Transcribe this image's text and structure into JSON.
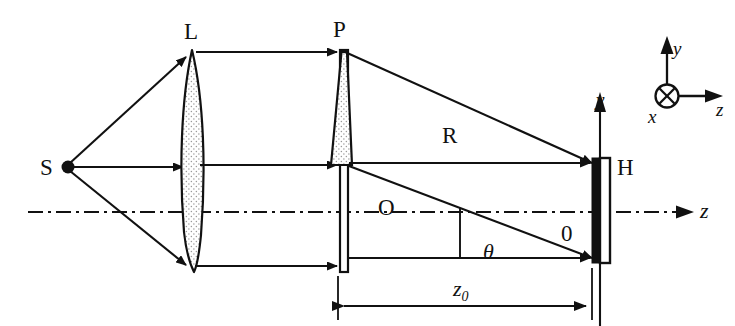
{
  "figure": {
    "kind": "optics-ray-diagram",
    "background_color": "#ffffff",
    "line_color": "#111111",
    "stipple_color": "#8a8a8a"
  },
  "labels": {
    "source": "S",
    "lens": "L",
    "object_plane": "P",
    "hologram_plane": "H",
    "reference_beam": "R",
    "object_beam": "O",
    "origin": "0",
    "angle": "θ",
    "axis_z": "z",
    "distance": "z",
    "distance_sub": "0",
    "inset_y": "y",
    "inset_x": "x",
    "inset_z": "z",
    "plane_y": "y"
  },
  "components": [
    {
      "name": "point-source",
      "label": "S",
      "x": 68,
      "y": 167
    },
    {
      "name": "collimating-lens",
      "label": "L",
      "x": 192,
      "top": 52,
      "bottom": 272
    },
    {
      "name": "object-plate",
      "label": "P",
      "x": 344,
      "top": 50,
      "bottom": 272
    },
    {
      "name": "hologram-plate",
      "label": "H",
      "x": 600,
      "top": 159,
      "bottom": 262
    }
  ],
  "rays": {
    "source_fan": [
      {
        "name": "upper-ray",
        "from": [
          68,
          167
        ],
        "to": [
          192,
          54
        ]
      },
      {
        "name": "axial-ray",
        "from": [
          68,
          167
        ],
        "to": [
          192,
          167
        ]
      },
      {
        "name": "lower-ray",
        "from": [
          68,
          167
        ],
        "to": [
          192,
          270
        ]
      }
    ],
    "collimated": [
      {
        "name": "top-collimated-ray",
        "from": [
          200,
          52
        ],
        "to": [
          344,
          52
        ]
      },
      {
        "name": "middle-collimated-ray",
        "from": [
          200,
          165
        ],
        "to": [
          344,
          165
        ]
      },
      {
        "name": "bottom-collimated-ray",
        "from": [
          200,
          266
        ],
        "to": [
          344,
          266
        ]
      }
    ],
    "to_hologram": [
      {
        "name": "reference-beam-R",
        "from": [
          344,
          52
        ],
        "to": [
          600,
          163
        ]
      },
      {
        "name": "object-beam-top",
        "from": [
          344,
          165
        ],
        "to": [
          600,
          163
        ]
      },
      {
        "name": "object-beam-O",
        "from": [
          344,
          165
        ],
        "to": [
          600,
          258
        ]
      },
      {
        "name": "object-beam-bottom",
        "from": [
          344,
          266
        ],
        "to": [
          600,
          258
        ]
      }
    ]
  },
  "axes": {
    "optical_axis_y": 212,
    "optical_axis_from_x": 28,
    "optical_axis_to_x": 690,
    "style": "dash-dot"
  },
  "dimension": {
    "name": "z0-distance",
    "label_main": "z",
    "label_sub": "0",
    "from_x": 338,
    "to_x": 592,
    "y": 306
  },
  "inset_axes": {
    "name": "coordinate-triad",
    "origin": [
      667,
      96
    ],
    "y_label": "y",
    "x_label": "x",
    "z_label": "z",
    "x_glyph": "circle-with-cross"
  }
}
